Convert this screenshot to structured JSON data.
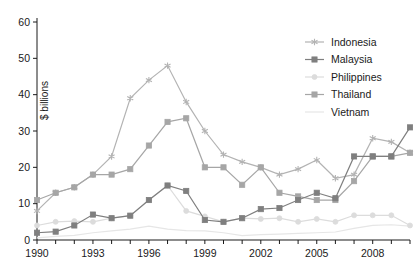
{
  "chart_data": {
    "type": "line",
    "title": "",
    "xlabel": "",
    "ylabel": "$ billions",
    "xlim": [
      1990,
      2010
    ],
    "ylim": [
      0,
      60
    ],
    "ytick_step": 10,
    "yticks": [
      0,
      10,
      20,
      30,
      40,
      50,
      60
    ],
    "xticks_major": [
      1990,
      1993,
      1996,
      1999,
      2002,
      2005,
      2008
    ],
    "xticks_all": [
      1990,
      1991,
      1992,
      1993,
      1994,
      1995,
      1996,
      1997,
      1998,
      1999,
      2000,
      2001,
      2002,
      2003,
      2004,
      2005,
      2006,
      2007,
      2008,
      2009,
      2010
    ],
    "grid": false,
    "legend_position": "top-right",
    "x": [
      1990,
      1991,
      1992,
      1993,
      1994,
      1995,
      1996,
      1997,
      1998,
      1999,
      2000,
      2001,
      2002,
      2003,
      2004,
      2005,
      2006,
      2007,
      2008,
      2009,
      2010
    ],
    "series": [
      {
        "name": "Indonesia",
        "color": "#b3b3b3",
        "marker": "star",
        "values": [
          8,
          13,
          14.5,
          18,
          23,
          39,
          44,
          48,
          38,
          30,
          23.5,
          21.5,
          20,
          18,
          19.5,
          22,
          17,
          18,
          28,
          27,
          24
        ]
      },
      {
        "name": "Malaysia",
        "color": "#7f7f7f",
        "marker": "square",
        "values": [
          2,
          2.3,
          4,
          7,
          6,
          6.7,
          11,
          15,
          13.5,
          5.5,
          5,
          6,
          8.5,
          8.8,
          11,
          13,
          11.5,
          23,
          23,
          23,
          31
        ]
      },
      {
        "name": "Philippines",
        "color": "#dcdcdc",
        "marker": "circle",
        "values": [
          4,
          5,
          5.2,
          5,
          6,
          6.7,
          11,
          15,
          8,
          6.5,
          5,
          6,
          5.8,
          6,
          5,
          5.8,
          5,
          6.8,
          6.8,
          6.8,
          4
        ]
      },
      {
        "name": "Thailand",
        "color": "#a6a6a6",
        "marker": "square",
        "values": [
          11,
          13,
          14.5,
          18,
          18,
          19.5,
          26,
          32.5,
          33.5,
          20,
          20,
          15.2,
          20,
          13,
          12,
          11,
          11,
          16.2,
          23,
          23,
          24
        ]
      },
      {
        "name": "Vietnam",
        "color": "#e6e6e6",
        "marker": "none",
        "values": [
          0.6,
          1,
          1.3,
          2,
          2.5,
          3,
          3.8,
          3,
          2.6,
          2.5,
          2,
          1.2,
          1.5,
          1.6,
          1.8,
          2,
          2.2,
          3.2,
          4,
          4.2,
          3.8
        ]
      }
    ]
  },
  "axis": {
    "y_axis_title": "$ billions",
    "y_tick_labels": [
      "0",
      "10",
      "20",
      "30",
      "40",
      "50",
      "60"
    ],
    "x_tick_labels": [
      "1990",
      "1993",
      "1996",
      "1999",
      "2002",
      "2005",
      "2008"
    ]
  },
  "legend": {
    "items": [
      {
        "label": "Indonesia"
      },
      {
        "label": "Malaysia"
      },
      {
        "label": "Philippines"
      },
      {
        "label": "Thailand"
      },
      {
        "label": "Vietnam"
      }
    ]
  }
}
